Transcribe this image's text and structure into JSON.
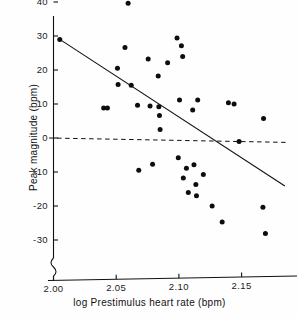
{
  "chart_data": {
    "type": "scatter",
    "title": "",
    "xlabel": "log Prestimulus heart rate (bpm)",
    "ylabel": "Peak magnitude (bpm)",
    "xlim": [
      1.9955,
      2.187
    ],
    "ylim": [
      -36.5,
      40.5
    ],
    "xticks": [
      2.0,
      2.05,
      2.1,
      2.15
    ],
    "xtick_labels": [
      "2.00",
      "2.05",
      "2.10",
      "2.15"
    ],
    "yticks": [
      40,
      30,
      20,
      10,
      0,
      -10,
      -20,
      -30
    ],
    "ytick_labels": [
      "40",
      "30",
      "20",
      "10",
      "0",
      "-10",
      "-20",
      "-30"
    ],
    "grid": false,
    "legend": null,
    "axis_break": {
      "axis": "y",
      "present": true,
      "note": "squiggle break below -30"
    },
    "points": [
      {
        "x": 2.005,
        "y": 29.0
      },
      {
        "x": 2.04,
        "y": 8.8
      },
      {
        "x": 2.043,
        "y": 8.8
      },
      {
        "x": 2.051,
        "y": 20.5
      },
      {
        "x": 2.0515,
        "y": 15.7
      },
      {
        "x": 2.057,
        "y": 26.6
      },
      {
        "x": 2.0595,
        "y": 39.6
      },
      {
        "x": 2.062,
        "y": 15.5
      },
      {
        "x": 2.067,
        "y": 9.6
      },
      {
        "x": 2.068,
        "y": -9.5
      },
      {
        "x": 2.0755,
        "y": 23.2
      },
      {
        "x": 2.077,
        "y": 9.4
      },
      {
        "x": 2.079,
        "y": -7.7
      },
      {
        "x": 2.0835,
        "y": 18.2
      },
      {
        "x": 2.084,
        "y": 9.2
      },
      {
        "x": 2.0845,
        "y": 6.6
      },
      {
        "x": 2.085,
        "y": 2.5
      },
      {
        "x": 2.091,
        "y": 22.1
      },
      {
        "x": 2.0985,
        "y": 29.4
      },
      {
        "x": 2.0995,
        "y": -5.8
      },
      {
        "x": 2.1005,
        "y": 11.2
      },
      {
        "x": 2.102,
        "y": 27.1
      },
      {
        "x": 2.103,
        "y": 24.0
      },
      {
        "x": 2.1035,
        "y": -11.8
      },
      {
        "x": 2.106,
        "y": -8.9
      },
      {
        "x": 2.1075,
        "y": -16.0
      },
      {
        "x": 2.111,
        "y": 8.2
      },
      {
        "x": 2.112,
        "y": -7.9
      },
      {
        "x": 2.1135,
        "y": -13.7
      },
      {
        "x": 2.114,
        "y": -17.0
      },
      {
        "x": 2.115,
        "y": 11.2
      },
      {
        "x": 2.1195,
        "y": -10.7
      },
      {
        "x": 2.1265,
        "y": -20.0
      },
      {
        "x": 2.1345,
        "y": -24.7
      },
      {
        "x": 2.1395,
        "y": 10.4
      },
      {
        "x": 2.144,
        "y": 10.0
      },
      {
        "x": 2.148,
        "y": -1.0
      },
      {
        "x": 2.1675,
        "y": 5.7
      },
      {
        "x": 2.167,
        "y": -20.4
      },
      {
        "x": 2.169,
        "y": -28.1
      }
    ],
    "lines": [
      {
        "name": "regression-line",
        "style": "solid",
        "x0": 2.005,
        "y0": 29.0,
        "x1": 2.1845,
        "y1": -14.1
      },
      {
        "name": "zero-reference-line",
        "style": "dashed",
        "x0": 1.9965,
        "y0": 0.0,
        "x1": 2.187,
        "y1": -1.3
      }
    ]
  }
}
